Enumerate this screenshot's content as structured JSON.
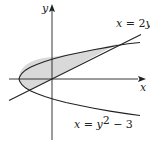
{
  "figure": {
    "axes": {
      "x_label": "x",
      "y_label": "y",
      "origin_px": [
        52,
        79
      ],
      "scale_px_per_unit": 11
    },
    "curves": [
      {
        "name": "line",
        "equation_label": "x = 2y",
        "label_lhs": "x",
        "label_eq": " = 2",
        "label_var": "y"
      },
      {
        "name": "parabola",
        "equation_label": "x = y^2 − 3",
        "label_lhs": "x",
        "label_eq": " = ",
        "label_var": "y",
        "label_exp": "2",
        "label_tail": " − 3"
      }
    ],
    "shaded_region": {
      "description": "Region enclosed between x = 2y and x = y^2 − 3",
      "fill_color": "#d9d9d9",
      "intersections": [
        [
          -2,
          -1
        ],
        [
          6,
          3
        ]
      ]
    },
    "colors": {
      "stroke": "#222222",
      "fill": "#d9d9d9",
      "background": "#ffffff"
    }
  }
}
